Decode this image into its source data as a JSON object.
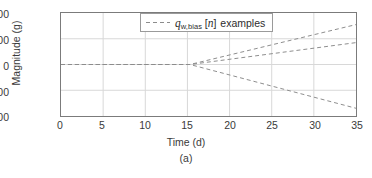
{
  "chart_data": {
    "type": "line",
    "title": "",
    "subtitle": "",
    "xlabel": "Time (d)",
    "ylabel": "Magnitude (g)",
    "caption": "(a)",
    "xlim": [
      0,
      35
    ],
    "ylim": [
      -200,
      200
    ],
    "xticks": [
      0,
      5,
      10,
      15,
      20,
      25,
      30,
      35
    ],
    "xticklabels": [
      "0",
      "5",
      "10",
      "15",
      "20",
      "25",
      "30",
      "35"
    ],
    "yticks": [
      -200,
      -100,
      0,
      100,
      200
    ],
    "yticklabels": [
      "-200",
      "-100",
      "0",
      "100",
      "200"
    ],
    "grid": true,
    "grid_color": "#d8d8d8",
    "axis_color": "#7b7b7b",
    "line_color": "#8c8c8c",
    "line_style": "dashed",
    "legend": {
      "position": "top-center",
      "entries": [
        {
          "label_prefix": "q",
          "label_subscript": "w,bias",
          "label_bracket_open": "[",
          "label_index": "n",
          "label_bracket_close": "]",
          "label_suffix": "examples",
          "label_plain": "q_w,bias [n] examples",
          "style": "dashed",
          "color": "#8c8c8c"
        }
      ]
    },
    "branch_point": {
      "x": 15.3,
      "y": 0
    },
    "series": [
      {
        "name": "bias-example-1-rising-steep",
        "points": [
          [
            0,
            0
          ],
          [
            15.3,
            0
          ],
          [
            35,
            155
          ]
        ]
      },
      {
        "name": "bias-example-2-rising-shallow",
        "points": [
          [
            0,
            0
          ],
          [
            15.3,
            0
          ],
          [
            35,
            85
          ]
        ]
      },
      {
        "name": "bias-example-3-falling",
        "points": [
          [
            0,
            0
          ],
          [
            15.3,
            0
          ],
          [
            35,
            -170
          ]
        ]
      }
    ]
  }
}
